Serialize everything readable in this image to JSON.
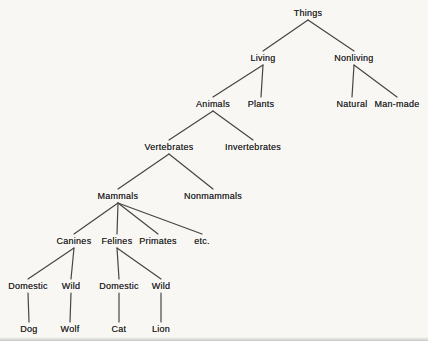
{
  "diagram": {
    "type": "tree",
    "colors": {
      "background": "#f8f7f4",
      "text": "#2b2b2b",
      "line": "#454545"
    },
    "nodes": [
      {
        "id": "things",
        "label": "Things",
        "x": 308,
        "y": 13
      },
      {
        "id": "living",
        "label": "Living",
        "x": 263,
        "y": 58
      },
      {
        "id": "nonliving",
        "label": "Nonliving",
        "x": 354,
        "y": 58
      },
      {
        "id": "animals",
        "label": "Animals",
        "x": 213,
        "y": 104
      },
      {
        "id": "plants",
        "label": "Plants",
        "x": 261,
        "y": 104
      },
      {
        "id": "natural",
        "label": "Natural",
        "x": 352,
        "y": 104
      },
      {
        "id": "man-made",
        "label": "Man-made",
        "x": 397,
        "y": 104
      },
      {
        "id": "vertebrates",
        "label": "Vertebrates",
        "x": 169,
        "y": 147
      },
      {
        "id": "invertebrates",
        "label": "Invertebrates",
        "x": 253,
        "y": 147
      },
      {
        "id": "mammals",
        "label": "Mammals",
        "x": 118,
        "y": 196
      },
      {
        "id": "nonmammals",
        "label": "Nonmammals",
        "x": 213,
        "y": 196
      },
      {
        "id": "canines",
        "label": "Canines",
        "x": 74,
        "y": 241
      },
      {
        "id": "felines",
        "label": "Felines",
        "x": 117,
        "y": 241
      },
      {
        "id": "primates",
        "label": "Primates",
        "x": 158,
        "y": 241
      },
      {
        "id": "etc",
        "label": "etc.",
        "x": 202,
        "y": 241
      },
      {
        "id": "domestic-canines",
        "label": "Domestic",
        "x": 28,
        "y": 286
      },
      {
        "id": "wild-canines",
        "label": "Wild",
        "x": 71,
        "y": 286
      },
      {
        "id": "domestic-felines",
        "label": "Domestic",
        "x": 119,
        "y": 286
      },
      {
        "id": "wild-felines",
        "label": "Wild",
        "x": 161,
        "y": 286
      },
      {
        "id": "dog",
        "label": "Dog",
        "x": 29,
        "y": 329
      },
      {
        "id": "wolf",
        "label": "Wolf",
        "x": 70,
        "y": 329
      },
      {
        "id": "cat",
        "label": "Cat",
        "x": 119,
        "y": 329
      },
      {
        "id": "lion",
        "label": "Lion",
        "x": 161,
        "y": 329
      }
    ],
    "edges": [
      [
        "things",
        "living"
      ],
      [
        "things",
        "nonliving"
      ],
      [
        "living",
        "animals"
      ],
      [
        "living",
        "plants"
      ],
      [
        "nonliving",
        "natural"
      ],
      [
        "nonliving",
        "man-made"
      ],
      [
        "animals",
        "vertebrates"
      ],
      [
        "animals",
        "invertebrates"
      ],
      [
        "vertebrates",
        "mammals"
      ],
      [
        "vertebrates",
        "nonmammals"
      ],
      [
        "mammals",
        "canines"
      ],
      [
        "mammals",
        "felines"
      ],
      [
        "mammals",
        "primates"
      ],
      [
        "mammals",
        "etc"
      ],
      [
        "canines",
        "domestic-canines"
      ],
      [
        "canines",
        "wild-canines"
      ],
      [
        "felines",
        "domestic-felines"
      ],
      [
        "felines",
        "wild-felines"
      ],
      [
        "domestic-canines",
        "dog"
      ],
      [
        "wild-canines",
        "wolf"
      ],
      [
        "domestic-felines",
        "cat"
      ],
      [
        "wild-felines",
        "lion"
      ]
    ]
  }
}
